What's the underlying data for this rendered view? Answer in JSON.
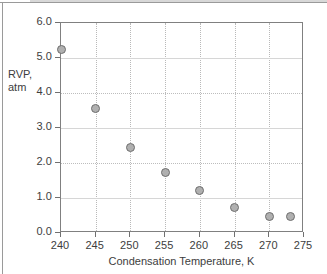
{
  "chart_data": {
    "type": "scatter",
    "title": "",
    "xlabel": "Condensation Temperature, K",
    "ylabel": "RVP,\natm",
    "ylabel_line1": "RVP,",
    "ylabel_line2": "atm",
    "xlim": [
      240,
      275
    ],
    "ylim": [
      0.0,
      6.0
    ],
    "xticks": [
      240,
      245,
      250,
      255,
      260,
      265,
      270,
      275
    ],
    "xtick_labels": [
      "240",
      "245",
      "250",
      "255",
      "260",
      "265",
      "270",
      "275"
    ],
    "yticks": [
      0.0,
      1.0,
      2.0,
      3.0,
      4.0,
      5.0,
      6.0
    ],
    "ytick_labels": [
      "0.0",
      "1.0",
      "2.0",
      "3.0",
      "4.0",
      "5.0",
      "6.0"
    ],
    "grid": true,
    "grid_style": "vertical dotted, horizontal solid light gray",
    "legend": false,
    "legend_position": "none",
    "marker": {
      "shape": "circle",
      "fill_color": "#b0b0b0",
      "edge_color": "#6e6e6e",
      "size_px": 9
    },
    "series": [
      {
        "name": "RVP vs Condensation Temperature",
        "x": [
          240,
          245,
          250,
          255,
          260,
          265,
          270,
          273
        ],
        "y": [
          5.25,
          3.55,
          2.45,
          1.72,
          1.22,
          0.72,
          0.48,
          0.47
        ]
      }
    ],
    "points": [
      {
        "x": 240,
        "y": 5.25
      },
      {
        "x": 245,
        "y": 3.55
      },
      {
        "x": 250,
        "y": 2.45
      },
      {
        "x": 255,
        "y": 1.72
      },
      {
        "x": 260,
        "y": 1.22
      },
      {
        "x": 265,
        "y": 0.72
      },
      {
        "x": 270,
        "y": 0.48
      },
      {
        "x": 273,
        "y": 0.47
      }
    ],
    "colors": {
      "axis": "#808080",
      "grid_vertical": "#b9b9b9",
      "grid_horizontal": "#d6d6d6",
      "text": "#3d3d3d",
      "background": "#ffffff",
      "frame": "#9a9a9a"
    }
  }
}
